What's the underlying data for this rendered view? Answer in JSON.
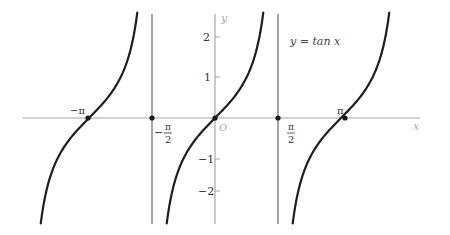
{
  "chart_data": {
    "type": "line",
    "title": "y = tan x",
    "xlabel": "x",
    "ylabel": "y",
    "origin_label": "O",
    "function": "tan(x)",
    "x_range": [
      -4.7,
      5.1
    ],
    "ylim": [
      -2.6,
      2.6
    ],
    "grid": false,
    "y_ticks": [
      {
        "value": 2,
        "label": "2"
      },
      {
        "value": 1,
        "label": "1"
      },
      {
        "value": -1,
        "label": "−1"
      },
      {
        "value": -2,
        "label": "−2"
      }
    ],
    "x_marks": [
      {
        "value": -3.14159,
        "label": "−π",
        "type": "zero"
      },
      {
        "value": -1.5708,
        "label_sign": "−",
        "label_num": "π",
        "label_den": "2",
        "type": "asymptote"
      },
      {
        "value": 0,
        "label": "O",
        "type": "zero"
      },
      {
        "value": 1.5708,
        "label_num": "π",
        "label_den": "2",
        "type": "asymptote"
      },
      {
        "value": 3.14159,
        "label": "π",
        "type": "zero"
      }
    ],
    "asymptotes": [
      -1.5708,
      1.5708
    ],
    "branches": [
      {
        "x_from": -4.71,
        "x_to": -1.5708,
        "name": "left-branch"
      },
      {
        "x_from": -1.5708,
        "x_to": 1.5708,
        "name": "center-branch"
      },
      {
        "x_from": 1.5708,
        "x_to": 4.71,
        "name": "right-branch"
      }
    ],
    "series": [
      {
        "name": "y = tan x",
        "color": "#1e1e1e"
      }
    ]
  },
  "labels": {
    "equation": "y = tan x",
    "y_axis": "y",
    "x_axis": "x",
    "origin": "O",
    "neg_pi": "−π",
    "pi": "π",
    "neg_half_pi_sign": "−",
    "half_pi_num": "π",
    "half_pi_den": "2",
    "tick_2": "2",
    "tick_1": "1",
    "tick_m1": "−1",
    "tick_m2": "−2"
  },
  "colors": {
    "curve": "#1e1e1e",
    "axis": "#a8a8a8",
    "asymptote": "#5a5a5a",
    "background": "#ffffff"
  }
}
